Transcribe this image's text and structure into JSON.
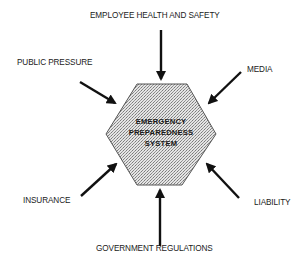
{
  "diagram": {
    "center": {
      "shape": "hexagon",
      "fill": "#c8c8c8",
      "stroke": "#555555",
      "lines": [
        "EMERGENCY",
        "PREPAREDNESS",
        "SYSTEM"
      ]
    },
    "influences": [
      {
        "id": "employee-health-and-safety",
        "label": "EMPLOYEE HEALTH AND SAFETY",
        "position": "top"
      },
      {
        "id": "media",
        "label": "MEDIA",
        "position": "top-right"
      },
      {
        "id": "liability",
        "label": "LIABILITY",
        "position": "bottom-right"
      },
      {
        "id": "government-regulations",
        "label": "GOVERNMENT REGULATIONS",
        "position": "bottom"
      },
      {
        "id": "insurance",
        "label": "INSURANCE",
        "position": "bottom-left"
      },
      {
        "id": "public-pressure",
        "label": "PUBLIC PRESSURE",
        "position": "top-left"
      }
    ],
    "arrow_color": "#111111"
  }
}
